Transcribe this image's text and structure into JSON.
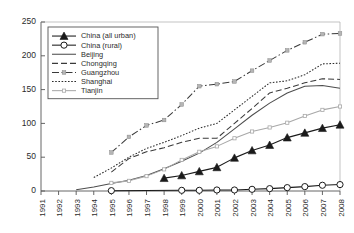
{
  "chart_data": {
    "type": "line",
    "title": "",
    "xlabel": "",
    "ylabel": "",
    "xlim": [
      1991,
      2008
    ],
    "ylim": [
      0,
      250
    ],
    "yticks": [
      0,
      50,
      100,
      150,
      200,
      250
    ],
    "grid": false,
    "legend_position": "top-left",
    "categories": [
      1991,
      1992,
      1993,
      1994,
      1995,
      1996,
      1997,
      1998,
      1999,
      2000,
      2001,
      2002,
      2003,
      2004,
      2005,
      2006,
      2007,
      2008
    ],
    "series": [
      {
        "name": "China (all urban)",
        "marker": "filled-triangle",
        "line": "solid",
        "color": "#1a1a1a",
        "x": [
          1998,
          1999,
          2000,
          2001,
          2002,
          2003,
          2004,
          2005,
          2006,
          2007,
          2008
        ],
        "values": [
          19,
          23,
          29,
          35,
          49,
          60,
          68,
          79,
          86,
          93,
          98
        ]
      },
      {
        "name": "China (rural)",
        "marker": "open-circle",
        "line": "solid",
        "color": "#1a1a1a",
        "x": [
          1995,
          1999,
          2000,
          2001,
          2002,
          2003,
          2004,
          2005,
          2006,
          2007,
          2008
        ],
        "values": [
          0.5,
          1,
          1,
          1.5,
          1.5,
          2.5,
          3.5,
          5,
          6.5,
          8.5,
          9.5
        ]
      },
      {
        "name": "Beijing",
        "marker": "none",
        "line": "solid",
        "color": "#4d4d4d",
        "x": [
          1993,
          1994,
          1995,
          1996,
          1997,
          1998,
          1999,
          2000,
          2001,
          2002,
          2003,
          2004,
          2005,
          2006,
          2007,
          2008
        ],
        "values": [
          2,
          6,
          11,
          16,
          23,
          33,
          44,
          56,
          72,
          92,
          112,
          130,
          145,
          155,
          156,
          152
        ]
      },
      {
        "name": "Chongqing",
        "marker": "none",
        "line": "dashed",
        "color": "#3a3a3a",
        "x": [
          1995,
          1996,
          1997,
          1998,
          1999,
          2000,
          2001,
          2002,
          2003,
          2004,
          2005,
          2006,
          2007,
          2008
        ],
        "values": [
          28,
          48,
          58,
          64,
          72,
          78,
          78,
          100,
          122,
          145,
          152,
          160,
          166,
          165
        ]
      },
      {
        "name": "Guangzhou",
        "marker": "small-square",
        "line": "dash-dot",
        "color": "#3a3a3a",
        "x": [
          1995,
          1996,
          1997,
          1998,
          1999,
          2000,
          2001,
          2002,
          2003,
          2004,
          2005,
          2006,
          2007,
          2008
        ],
        "values": [
          57,
          80,
          97,
          105,
          128,
          155,
          158,
          162,
          178,
          193,
          208,
          220,
          232,
          233
        ]
      },
      {
        "name": "Shanghai",
        "marker": "none",
        "line": "dotted",
        "color": "#2b2b2b",
        "x": [
          1994,
          1995,
          1996,
          1997,
          1998,
          1999,
          2000,
          2001,
          2002,
          2003,
          2004,
          2005,
          2006,
          2007,
          2008
        ],
        "values": [
          20,
          34,
          50,
          63,
          72,
          82,
          93,
          100,
          120,
          140,
          160,
          163,
          172,
          188,
          189
        ]
      },
      {
        "name": "Tianjin",
        "marker": "small-plus",
        "line": "solid",
        "color": "#a8a8a8",
        "x": [
          1995,
          1996,
          1997,
          1998,
          1999,
          2000,
          2001,
          2002,
          2003,
          2004,
          2005,
          2006,
          2007,
          2008
        ],
        "values": [
          12,
          15,
          22,
          32,
          46,
          58,
          66,
          78,
          88,
          94,
          101,
          111,
          120,
          125
        ]
      }
    ]
  }
}
